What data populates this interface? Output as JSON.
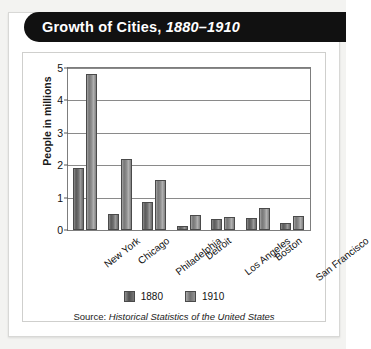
{
  "banner": {
    "title_main": "Growth of Cities,",
    "title_years": "1880–1910"
  },
  "chart_data": {
    "type": "bar",
    "title": "Growth of Cities, 1880–1910",
    "xlabel": "",
    "ylabel": "People in millions",
    "ylim": [
      0,
      5
    ],
    "yticks": [
      0,
      1,
      2,
      3,
      4,
      5
    ],
    "ytick_labels": [
      "0",
      "1",
      "2",
      "3",
      "4",
      "5"
    ],
    "grid": true,
    "legend_position": "bottom",
    "categories": [
      "New York",
      "Chicago",
      "Philadelphia",
      "Detroit",
      "Los Angeles",
      "Boston",
      "San Francisco"
    ],
    "series": [
      {
        "name": "1880",
        "color": "#5e5e5e",
        "values": [
          1.9,
          0.5,
          0.85,
          0.12,
          0.33,
          0.36,
          0.23
        ]
      },
      {
        "name": "1910",
        "color": "#8c8c8c",
        "values": [
          4.8,
          2.2,
          1.55,
          0.46,
          0.4,
          0.67,
          0.42
        ]
      }
    ],
    "source_prefix": "Source:",
    "source_title": "Historical Statistics of the United States"
  },
  "colors": {
    "banner_background": "#111111",
    "banner_text": "#ffffff",
    "panel_background": "#ffffff",
    "page_background": "#f3f3f1",
    "gridline": "#8a8a8a"
  }
}
